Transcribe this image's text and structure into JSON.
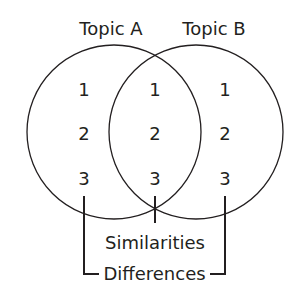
{
  "diagram": {
    "type": "venn",
    "sets": [
      {
        "label": "Topic A",
        "items": [
          "1",
          "2",
          "3"
        ]
      },
      {
        "label": "Topic B",
        "items": [
          "1",
          "2",
          "3"
        ]
      }
    ],
    "intersection": {
      "items": [
        "1",
        "2",
        "3"
      ]
    },
    "annotations": {
      "similarities": "Similarities",
      "differences": "Differences"
    },
    "colors": {
      "line": "#231f20",
      "background": "#ffffff"
    }
  }
}
